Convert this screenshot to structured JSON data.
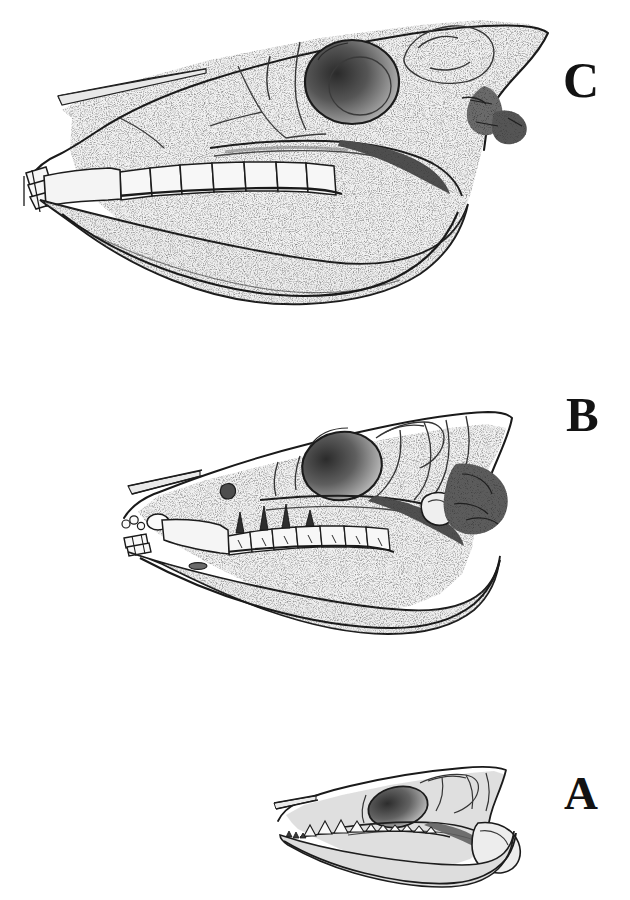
{
  "plate": {
    "title": "Comparative lateral views of three fossil horse skulls",
    "background_color": "#ffffff",
    "ink_color": "#1a1a1a",
    "width": 630,
    "height": 900,
    "medium": "stippled pen-and-ink engraving",
    "caption": ""
  },
  "figures": [
    {
      "key": "C",
      "label": "C",
      "label_position": "right",
      "order_on_plate": 1,
      "vertical_zone": "top",
      "relative_size": "largest",
      "description": "Large long-faced horse skull in left lateral view with deep mandible, high-crowned (hypsodont) cheek teeth, long diastema and chisel-shaped incisors",
      "features": {
        "orbit": "large, round, heavily shaded dark",
        "cheek_teeth": "high-crowned rectangular molars, 6 visible",
        "incisors": "chisel-shaped, 3 visible at front",
        "diastema": "long",
        "mandible": "deep, expanded angular region",
        "zygomatic_arch": "strong, shaded beneath orbit",
        "nasal_notch": "deep, nasal bone drawn as thin pointed blade"
      }
    },
    {
      "key": "B",
      "label": "B",
      "label_position": "right",
      "order_on_plate": 2,
      "vertical_zone": "middle",
      "relative_size": "intermediate",
      "description": "Medium three-toed horse skull in left lateral view with moderately deep jaw, low-crowned cusped cheek teeth and a shorter face",
      "features": {
        "orbit": "oval, shaded dark, placed mid-skull",
        "cheek_teeth": "low-crowned cusped molars, 7 visible",
        "incisors": "small, set forward of a short diastema",
        "diastema": "moderate",
        "mandible": "moderately deep with rounded angle",
        "zygomatic_arch": "slender, arching",
        "occipital_region": "dark shaded, overhanging"
      }
    },
    {
      "key": "A",
      "label": "A",
      "label_position": "right",
      "order_on_plate": 3,
      "vertical_zone": "bottom",
      "relative_size": "smallest",
      "description": "Small primitive horse (eohippus-grade) skull in left lateral view with shallow jaw, short face and sharp-cusped brachydont teeth",
      "features": {
        "orbit": "oval, shaded, set far back",
        "cheek_teeth": "small sharply cusped teeth in a continuous row",
        "incisors": "small and crowded at the tip of the snout",
        "diastema": "very short",
        "mandible": "shallow and slender",
        "occipital_region": "short, blunt"
      }
    }
  ],
  "labels": {
    "A": "A",
    "B": "B",
    "C": "C"
  }
}
